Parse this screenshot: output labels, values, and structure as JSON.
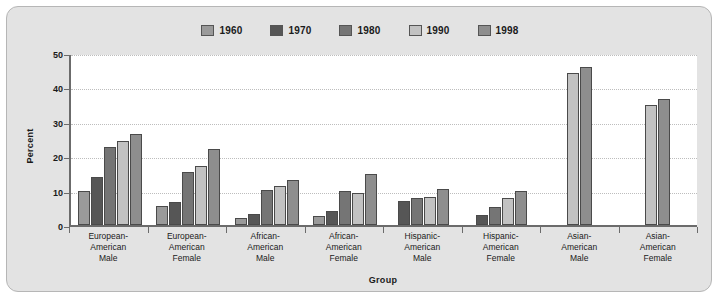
{
  "chart_data": {
    "type": "bar",
    "title": "",
    "xlabel": "Group",
    "ylabel": "Percent",
    "ylim": [
      0,
      50
    ],
    "yticks": [
      0,
      10,
      20,
      30,
      40,
      50
    ],
    "grid": true,
    "legend_position": "top-center",
    "categories": [
      "European-\nAmerican\nMale",
      "European-\nAmerican\nFemale",
      "African-\nAmerican\nMale",
      "African-\nAmerican\nFemale",
      "Hispanic-\nAmerican\nMale",
      "Hispanic-\nAmerican\nFemale",
      "Asian-\nAmerican\nMale",
      "Asian-\nAmerican\nFemale"
    ],
    "series": [
      {
        "name": "1960",
        "color": "#9a9a9a",
        "values": [
          10,
          5.5,
          2.2,
          2.7,
          null,
          null,
          null,
          null
        ]
      },
      {
        "name": "1970",
        "color": "#565656",
        "values": [
          14,
          6.7,
          3.1,
          4.0,
          7.1,
          3.0,
          null,
          null
        ]
      },
      {
        "name": "1980",
        "color": "#757575",
        "values": [
          23,
          15.5,
          10.2,
          10.0,
          8.0,
          5.4,
          null,
          null
        ]
      },
      {
        "name": "1990",
        "color": "#c2c2c2",
        "values": [
          24.7,
          17.5,
          11.4,
          9.5,
          8.2,
          8.0,
          44.8,
          35.4
        ]
      },
      {
        "name": "1998",
        "color": "#8e8e8e",
        "values": [
          26.8,
          22.3,
          13.1,
          15.1,
          10.7,
          10.1,
          46.6,
          37.2
        ]
      }
    ]
  },
  "legend": {
    "items": [
      {
        "label": "1960"
      },
      {
        "label": "1970"
      },
      {
        "label": "1980"
      },
      {
        "label": "1990"
      },
      {
        "label": "1998"
      }
    ]
  },
  "axis": {
    "y_title": "Percent",
    "x_title": "Group",
    "y_tick_labels": [
      "50",
      "40",
      "30",
      "20",
      "10",
      "0"
    ]
  },
  "colors": {
    "panel_background": "#e3e3e3",
    "plot_background": "#ffffff",
    "axis": "#6b6b6b",
    "gridline": "#bdbdbd",
    "text": "#1a1a1a"
  }
}
